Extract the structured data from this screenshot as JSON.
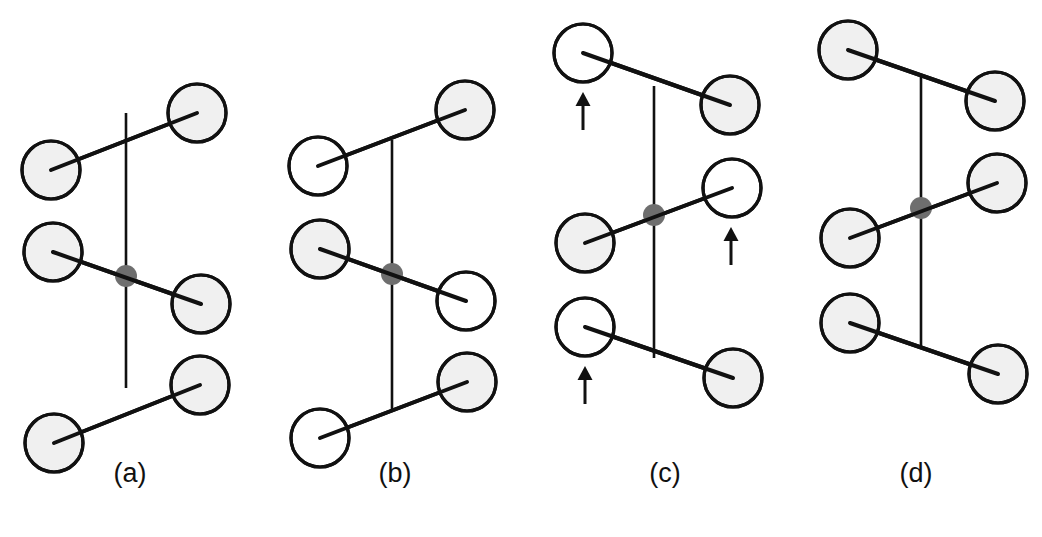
{
  "figure": {
    "width": 1042,
    "height": 537,
    "background": "#ffffff"
  },
  "style": {
    "node_fill_shaded": "#f0f0f0",
    "node_fill_open": "#ffffff",
    "node_stroke": "#111111",
    "node_stroke_width": 3.2,
    "node_radius": 29,
    "pivot_fill": "#6e6e6e",
    "pivot_radius": 11,
    "line_color": "#111111",
    "spine_width": 2.6,
    "bar_width": 4.0,
    "arrow_color": "#111111",
    "arrow_width": 3.0,
    "label_color": "#111111",
    "label_font_size": 27
  },
  "legend_keys": {
    "shaded": "shaded-node",
    "open": "open-node",
    "pivot": "pivot-dot",
    "arrow": "up-arrow-marker"
  },
  "panels": [
    {
      "id": "a",
      "label": "(a)",
      "x": 0,
      "width": 260,
      "spine_x": 126,
      "spine_y1": 113,
      "spine_y2": 388,
      "pivot": {
        "x": 126,
        "y": 276
      },
      "bars": [
        {
          "name": "top-bar",
          "x1": 51,
          "y1": 170,
          "x2": 197,
          "y2": 113
        },
        {
          "name": "middle-bar",
          "x1": 53,
          "y1": 252,
          "x2": 201,
          "y2": 304
        },
        {
          "name": "bottom-bar",
          "x1": 54,
          "y1": 443,
          "x2": 200,
          "y2": 385
        }
      ],
      "nodes": [
        {
          "name": "node-top-left",
          "x": 51,
          "y": 170,
          "fill": "shaded"
        },
        {
          "name": "node-top-right",
          "x": 197,
          "y": 113,
          "fill": "shaded"
        },
        {
          "name": "node-mid-left",
          "x": 53,
          "y": 252,
          "fill": "shaded"
        },
        {
          "name": "node-mid-right",
          "x": 201,
          "y": 304,
          "fill": "shaded"
        },
        {
          "name": "node-bot-left",
          "x": 54,
          "y": 443,
          "fill": "shaded"
        },
        {
          "name": "node-bot-right",
          "x": 200,
          "y": 385,
          "fill": "shaded"
        }
      ],
      "arrows": []
    },
    {
      "id": "b",
      "label": "(b)",
      "x": 260,
      "width": 270,
      "spine_x": 132,
      "spine_y1": 140,
      "spine_y2": 412,
      "pivot": {
        "x": 132,
        "y": 274
      },
      "bars": [
        {
          "name": "top-bar",
          "x1": 58,
          "y1": 166,
          "x2": 205,
          "y2": 110
        },
        {
          "name": "middle-bar",
          "x1": 60,
          "y1": 249,
          "x2": 206,
          "y2": 301
        },
        {
          "name": "bottom-bar",
          "x1": 60,
          "y1": 438,
          "x2": 207,
          "y2": 382
        }
      ],
      "nodes": [
        {
          "name": "node-top-left",
          "x": 58,
          "y": 166,
          "fill": "open"
        },
        {
          "name": "node-top-right",
          "x": 205,
          "y": 110,
          "fill": "shaded"
        },
        {
          "name": "node-mid-left",
          "x": 60,
          "y": 249,
          "fill": "shaded"
        },
        {
          "name": "node-mid-right",
          "x": 206,
          "y": 301,
          "fill": "open"
        },
        {
          "name": "node-bot-left",
          "x": 60,
          "y": 438,
          "fill": "open"
        },
        {
          "name": "node-bot-right",
          "x": 207,
          "y": 382,
          "fill": "shaded"
        }
      ],
      "arrows": []
    },
    {
      "id": "c",
      "label": "(c)",
      "x": 530,
      "width": 270,
      "spine_x": 124,
      "spine_y1": 86,
      "spine_y2": 358,
      "pivot": {
        "x": 124,
        "y": 215
      },
      "bars": [
        {
          "name": "top-bar",
          "x1": 53,
          "y1": 53,
          "x2": 200,
          "y2": 105
        },
        {
          "name": "middle-bar",
          "x1": 55,
          "y1": 243,
          "x2": 202,
          "y2": 188
        },
        {
          "name": "bottom-bar",
          "x1": 55,
          "y1": 327,
          "x2": 203,
          "y2": 378
        }
      ],
      "nodes": [
        {
          "name": "node-top-left",
          "x": 53,
          "y": 53,
          "fill": "open"
        },
        {
          "name": "node-top-right",
          "x": 200,
          "y": 105,
          "fill": "shaded"
        },
        {
          "name": "node-mid-left",
          "x": 55,
          "y": 243,
          "fill": "shaded"
        },
        {
          "name": "node-mid-right",
          "x": 202,
          "y": 188,
          "fill": "open"
        },
        {
          "name": "node-bot-left",
          "x": 55,
          "y": 327,
          "fill": "open"
        },
        {
          "name": "node-bot-right",
          "x": 203,
          "y": 378,
          "fill": "shaded"
        }
      ],
      "arrows": [
        {
          "name": "arrow-top-left",
          "x": 53,
          "y_tip": 92,
          "y_tail": 130
        },
        {
          "name": "arrow-mid-right",
          "x": 201,
          "y_tip": 227,
          "y_tail": 265
        },
        {
          "name": "arrow-bot-left",
          "x": 55,
          "y_tip": 366,
          "y_tail": 404
        }
      ]
    },
    {
      "id": "d",
      "label": "(d)",
      "x": 790,
      "width": 252,
      "spine_x": 131,
      "spine_y1": 76,
      "spine_y2": 348,
      "pivot": {
        "x": 131,
        "y": 208
      },
      "bars": [
        {
          "name": "top-bar",
          "x1": 58,
          "y1": 50,
          "x2": 205,
          "y2": 101
        },
        {
          "name": "middle-bar",
          "x1": 60,
          "y1": 238,
          "x2": 207,
          "y2": 183
        },
        {
          "name": "bottom-bar",
          "x1": 60,
          "y1": 323,
          "x2": 208,
          "y2": 374
        }
      ],
      "nodes": [
        {
          "name": "node-top-left",
          "x": 58,
          "y": 50,
          "fill": "shaded"
        },
        {
          "name": "node-top-right",
          "x": 205,
          "y": 101,
          "fill": "shaded"
        },
        {
          "name": "node-mid-left",
          "x": 60,
          "y": 238,
          "fill": "shaded"
        },
        {
          "name": "node-mid-right",
          "x": 207,
          "y": 183,
          "fill": "shaded"
        },
        {
          "name": "node-bot-left",
          "x": 60,
          "y": 323,
          "fill": "shaded"
        },
        {
          "name": "node-bot-right",
          "x": 208,
          "y": 374,
          "fill": "shaded"
        }
      ],
      "arrows": []
    }
  ]
}
